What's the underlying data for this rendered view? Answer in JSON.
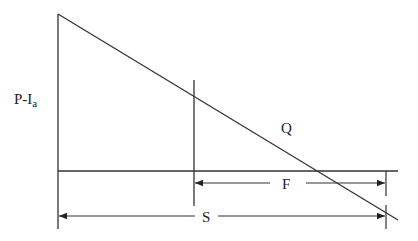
{
  "diagram": {
    "labels": {
      "y_axis": "P-I",
      "y_axis_subscript": "a",
      "line": "Q",
      "f_dimension": "F",
      "s_dimension": "S"
    },
    "colors": {
      "stroke": "#333333",
      "background": "#ffffff"
    }
  }
}
